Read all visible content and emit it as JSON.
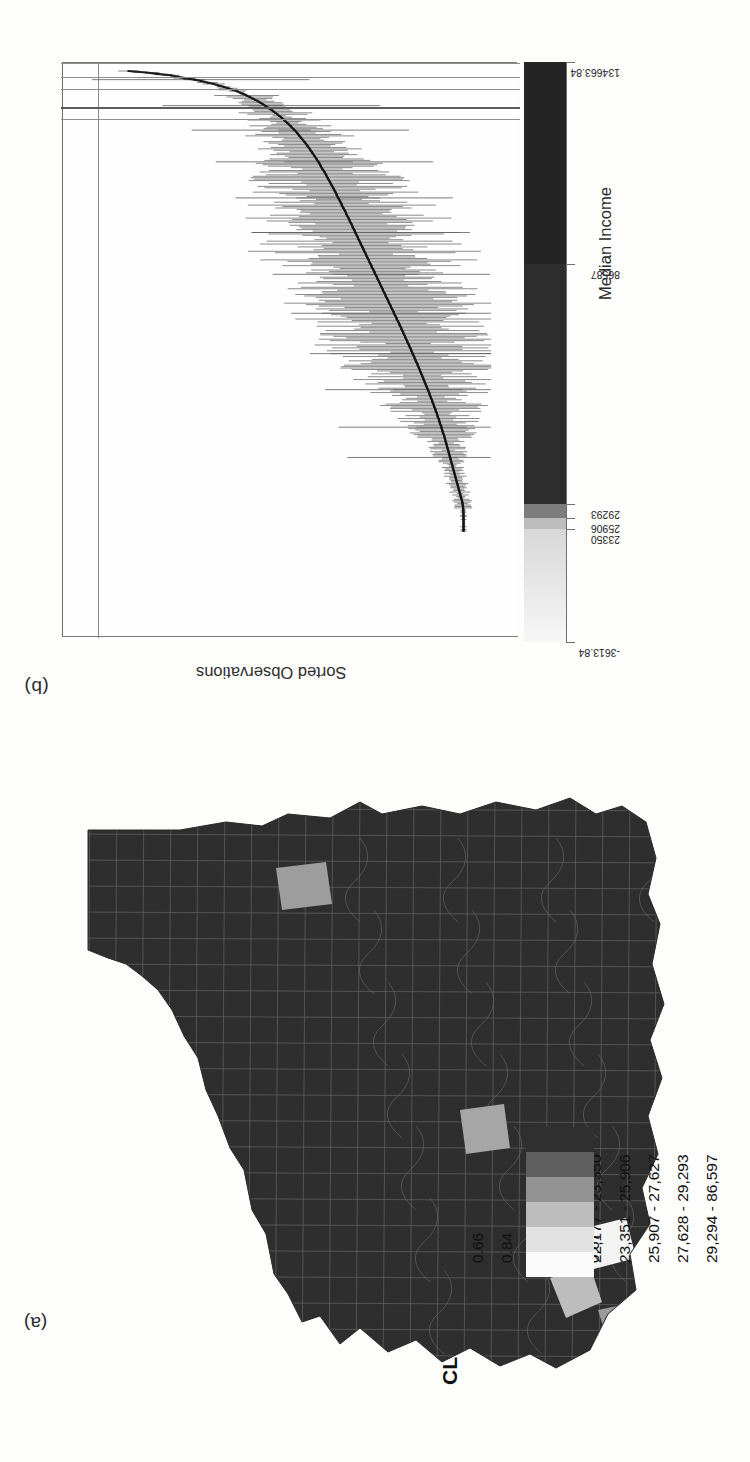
{
  "figure": {
    "panel_a_label": "(a)",
    "panel_b_label": "(b)"
  },
  "panel_b": {
    "x_axis_title": "Sorted Observations",
    "ramp_title": "Median Income",
    "ramp_tick_labels": [
      "-3613.84",
      "23350",
      "25906",
      "29293",
      "86587",
      "134663.84"
    ],
    "ramp_tick_values": [
      -3613.84,
      23350,
      25906,
      29293,
      86587,
      134663.84
    ]
  },
  "panel_a": {
    "legend": {
      "cl_header": "CL",
      "estimate_header": "Estimate",
      "rows": [
        {
          "cl": "",
          "estimate": "22,176",
          "color": "#fbfbfb"
        },
        {
          "cl": "0.66",
          "estimate": "22,177 - 23,350",
          "color": "#e2e2e2"
        },
        {
          "cl": "0.84",
          "estimate": "23,351 - 25,906",
          "color": "#bdbdbd"
        },
        {
          "cl": "0.64",
          "estimate": "25,907 - 27,627",
          "color": "#939393"
        },
        {
          "cl": "0.69",
          "estimate": "27,628 - 29,293",
          "color": "#5e5e5e"
        },
        {
          "cl": "0.67",
          "estimate": "29,294 - 86,597",
          "color": "#2f2f2f"
        }
      ]
    }
  },
  "chart_data": {
    "type": "line",
    "title": "",
    "subtitle": "",
    "xlabel": "Sorted Observations",
    "ylabel": "Median Income",
    "grid": false,
    "legend_position": "none",
    "xlim": [
      0,
      330
    ],
    "ylim": [
      -3613.84,
      134663.84
    ],
    "reference_lines": [
      22176,
      23350,
      25906,
      27627,
      29293
    ],
    "colour_ramp_breaks": [
      -3613.84,
      23350,
      25906,
      29293,
      86587,
      134663.84
    ],
    "colour_ramp_colors": [
      "#e8e8e8",
      "#bdbdbd",
      "#7d7d7d",
      "#2d2d2d",
      "#242424"
    ],
    "series": [
      {
        "name": "Point estimate (sorted)",
        "n": 330,
        "y_first": 101000,
        "y_last": 16200,
        "note": "Monotonically decreasing sorted estimates from roughly 101,000 down to about 16,200."
      },
      {
        "name": "95% CI half-width",
        "note": "Whisker half-widths grow from roughly 2,500 at the left tail to 18,000-20,000 for the widest intervals near the middle-right of the ordering."
      }
    ],
    "estimates": [
      101000,
      96500,
      93800,
      90200,
      88500,
      86900,
      84200,
      82600,
      81000,
      79400,
      78200,
      76900,
      75800,
      74600,
      73500,
      72700,
      71900,
      71100,
      70300,
      69600,
      68900,
      68200,
      67600,
      67000,
      66400,
      65900,
      65300,
      64800,
      64300,
      63800,
      63300,
      62900,
      62400,
      62000,
      61600,
      61200,
      60800,
      60400,
      60000,
      59700,
      59300,
      59000,
      58600,
      58300,
      58000,
      57700,
      57400,
      57100,
      56800,
      56500,
      56200,
      55900,
      55700,
      55400,
      55100,
      54900,
      54600,
      54400,
      54100,
      53900,
      53600,
      53400,
      53200,
      52900,
      52700,
      52500,
      52300,
      52100,
      51900,
      51600,
      51400,
      51200,
      51000,
      50800,
      50600,
      50400,
      50200,
      50000,
      49800,
      49600,
      49400,
      49200,
      49000,
      48800,
      48600,
      48400,
      48300,
      48100,
      47900,
      47700,
      47500,
      47300,
      47100,
      47000,
      46800,
      46600,
      46400,
      46200,
      46000,
      45900,
      45700,
      45500,
      45300,
      45100,
      45000,
      44800,
      44600,
      44400,
      44300,
      44100,
      43900,
      43700,
      43600,
      43400,
      43200,
      43000,
      42900,
      42700,
      42500,
      42300,
      42200,
      42000,
      41800,
      41600,
      41500,
      41300,
      41100,
      40900,
      40800,
      40600,
      40400,
      40200,
      40100,
      39900,
      39700,
      39500,
      39400,
      39200,
      39000,
      38800,
      38700,
      38500,
      38300,
      38100,
      38000,
      37800,
      37600,
      37400,
      37300,
      37100,
      36900,
      36700,
      36600,
      36400,
      36200,
      36000,
      35900,
      35700,
      35500,
      35300,
      35200,
      35000,
      34800,
      34600,
      34500,
      34300,
      34100,
      33900,
      33800,
      33600,
      33400,
      33200,
      33100,
      32900,
      32700,
      32500,
      32400,
      32200,
      32000,
      31900,
      31700,
      31500,
      31400,
      31200,
      31000,
      30900,
      30700,
      30500,
      30400,
      30200,
      30000,
      29900,
      29700,
      29500,
      29400,
      29200,
      29100,
      28900,
      28700,
      28600,
      28400,
      28300,
      28100,
      27900,
      27800,
      27600,
      27500,
      27300,
      27200,
      27000,
      26900,
      26700,
      26600,
      26400,
      26300,
      26100,
      26000,
      25800,
      25700,
      25500,
      25400,
      25200,
      25100,
      24900,
      24800,
      24700,
      24500,
      24400,
      24200,
      24100,
      24000,
      23800,
      23700,
      23600,
      23400,
      23300,
      23200,
      23000,
      22900,
      22800,
      22700,
      22500,
      22400,
      22300,
      22200,
      22100,
      21900,
      21800,
      21700,
      21600,
      21500,
      21400,
      21200,
      21100,
      21000,
      20900,
      20800,
      20700,
      20600,
      20500,
      20400,
      20300,
      20200,
      20100,
      20000,
      19900,
      19800,
      19700,
      19600,
      19500,
      19400,
      19300,
      19200,
      19100,
      19000,
      18900,
      18800,
      18700,
      18600,
      18500,
      18400,
      18300,
      18200,
      18100,
      18000,
      17900,
      17800,
      17700,
      17600,
      17500,
      17400,
      17300,
      17200,
      17100,
      17000,
      16900,
      16800,
      16700,
      16600,
      16500,
      16450,
      16400,
      16350,
      16300,
      16280,
      16260,
      16240,
      16230,
      16220,
      16210,
      16205,
      16203,
      16202,
      16201,
      16200,
      16200,
      16200,
      16200,
      16200,
      16200
    ]
  }
}
